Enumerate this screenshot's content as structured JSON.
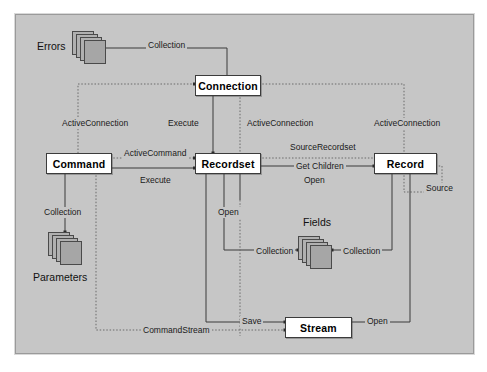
{
  "diagram": {
    "background_color": "#c6c6c6",
    "box_fill": "#ffffff",
    "line_color": "#3b3b3b",
    "objects": [
      {
        "id": "connection",
        "label": "Connection",
        "x": 195,
        "y": 75,
        "w": 64,
        "h": 19
      },
      {
        "id": "command",
        "label": "Command",
        "x": 46,
        "y": 153,
        "w": 64,
        "h": 19
      },
      {
        "id": "recordset",
        "label": "Recordset",
        "x": 195,
        "y": 153,
        "w": 64,
        "h": 19
      },
      {
        "id": "record",
        "label": "Record",
        "x": 374,
        "y": 153,
        "w": 61,
        "h": 19
      },
      {
        "id": "stream",
        "label": "Stream",
        "x": 285,
        "y": 317,
        "w": 65,
        "h": 19
      }
    ],
    "collections": [
      {
        "id": "errors",
        "label": "Errors",
        "x": 72,
        "y": 31,
        "label_x": 37,
        "label_y": 47
      },
      {
        "id": "parameters",
        "label": "Parameters",
        "x": 48,
        "y": 232,
        "label_x": 33,
        "label_y": 274
      },
      {
        "id": "fields",
        "label": "Fields",
        "x": 298,
        "y": 236,
        "label_x": 303,
        "label_y": 223
      }
    ],
    "edge_labels": [
      {
        "id": "errors-collection",
        "text": "Collection",
        "x": 146,
        "y": 44
      },
      {
        "id": "command-activeconnection",
        "text": "ActiveConnection",
        "x": 60,
        "y": 118
      },
      {
        "id": "recordset-execute-top",
        "text": "Execute",
        "x": 166,
        "y": 118
      },
      {
        "id": "recordset-activeconnection",
        "text": "ActiveConnection",
        "x": 245,
        "y": 118
      },
      {
        "id": "record-activeconnection",
        "text": "ActiveConnection",
        "x": 372,
        "y": 118
      },
      {
        "id": "activecommand",
        "text": "ActiveCommand",
        "x": 122,
        "y": 148
      },
      {
        "id": "sourcerecordset",
        "text": "SourceRecordset",
        "x": 288,
        "y": 146
      },
      {
        "id": "getchildren",
        "text": "Get Children",
        "x": 294,
        "y": 160
      },
      {
        "id": "command-execute",
        "text": "Execute",
        "x": 138,
        "y": 177
      },
      {
        "id": "record-open",
        "text": "Open",
        "x": 302,
        "y": 177
      },
      {
        "id": "record-source",
        "text": "Source",
        "x": 424,
        "y": 187
      },
      {
        "id": "parameters-collection",
        "text": "Collection",
        "x": 42,
        "y": 211
      },
      {
        "id": "recordset-open-down",
        "text": "Open",
        "x": 218,
        "y": 211
      },
      {
        "id": "fields-collection-left",
        "text": "Collection",
        "x": 256,
        "y": 253
      },
      {
        "id": "fields-collection-right",
        "text": "Collection",
        "x": 343,
        "y": 253
      },
      {
        "id": "stream-save",
        "text": "Save",
        "x": 240,
        "y": 320
      },
      {
        "id": "commandstream",
        "text": "CommandStream",
        "x": 141,
        "y": 327
      },
      {
        "id": "stream-open",
        "text": "Open",
        "x": 367,
        "y": 320
      }
    ]
  }
}
